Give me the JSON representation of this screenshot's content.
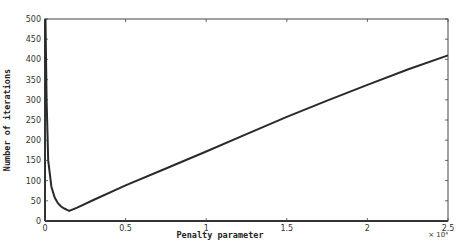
{
  "chart_data": {
    "type": "line",
    "title": "",
    "xlabel": "Penalty parameter",
    "ylabel": "Number of iterations",
    "x_multiplier": "× 10⁴",
    "xlim": [
      0,
      2.5
    ],
    "ylim": [
      0,
      500
    ],
    "x_ticks": [
      "0",
      "0.5",
      "1",
      "1.5",
      "2",
      "2.5"
    ],
    "y_ticks": [
      "0",
      "50",
      "100",
      "150",
      "200",
      "250",
      "300",
      "350",
      "400",
      "450",
      "500"
    ],
    "grid": false,
    "legend": null,
    "series": [
      {
        "name": "iterations",
        "x": [
          0.003,
          0.01,
          0.02,
          0.04,
          0.06,
          0.08,
          0.1,
          0.12,
          0.14,
          0.15,
          0.2,
          0.3,
          0.5,
          0.75,
          1.0,
          1.25,
          1.5,
          1.75,
          2.0,
          2.25,
          2.5
        ],
        "y": [
          500,
          300,
          150,
          85,
          58,
          44,
          36,
          31,
          27,
          25,
          33,
          52,
          88,
          130,
          172,
          215,
          258,
          298,
          337,
          375,
          410
        ]
      }
    ]
  }
}
